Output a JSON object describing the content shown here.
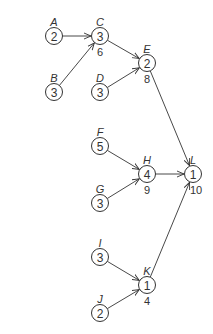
{
  "diagram": {
    "type": "activity-network",
    "nodes": [
      {
        "id": "A",
        "label": "A",
        "value": "2",
        "sub": "",
        "x": 54,
        "y": 36
      },
      {
        "id": "B",
        "label": "B",
        "value": "3",
        "sub": "",
        "x": 54,
        "y": 92
      },
      {
        "id": "C",
        "label": "C",
        "value": "3",
        "sub": "6",
        "x": 100,
        "y": 36
      },
      {
        "id": "D",
        "label": "D",
        "value": "3",
        "sub": "",
        "x": 100,
        "y": 92
      },
      {
        "id": "E",
        "label": "E",
        "value": "2",
        "sub": "8",
        "x": 147,
        "y": 63
      },
      {
        "id": "F",
        "label": "F",
        "value": "5",
        "sub": "",
        "x": 100,
        "y": 146
      },
      {
        "id": "G",
        "label": "G",
        "value": "3",
        "sub": "",
        "x": 100,
        "y": 203
      },
      {
        "id": "H",
        "label": "H",
        "value": "4",
        "sub": "9",
        "x": 147,
        "y": 174
      },
      {
        "id": "I",
        "label": "I",
        "value": "3",
        "sub": "",
        "x": 100,
        "y": 257
      },
      {
        "id": "J",
        "label": "J",
        "value": "2",
        "sub": "",
        "x": 100,
        "y": 313
      },
      {
        "id": "K",
        "label": "K",
        "value": "1",
        "sub": "4",
        "x": 147,
        "y": 285
      },
      {
        "id": "L",
        "label": "L",
        "value": "1",
        "sub": "10",
        "x": 193,
        "y": 174
      }
    ],
    "edges": [
      {
        "from": "A",
        "to": "C"
      },
      {
        "from": "B",
        "to": "C"
      },
      {
        "from": "C",
        "to": "E"
      },
      {
        "from": "D",
        "to": "E"
      },
      {
        "from": "E",
        "to": "L"
      },
      {
        "from": "F",
        "to": "H"
      },
      {
        "from": "G",
        "to": "H"
      },
      {
        "from": "H",
        "to": "L"
      },
      {
        "from": "I",
        "to": "K"
      },
      {
        "from": "J",
        "to": "K"
      },
      {
        "from": "K",
        "to": "L"
      }
    ]
  }
}
